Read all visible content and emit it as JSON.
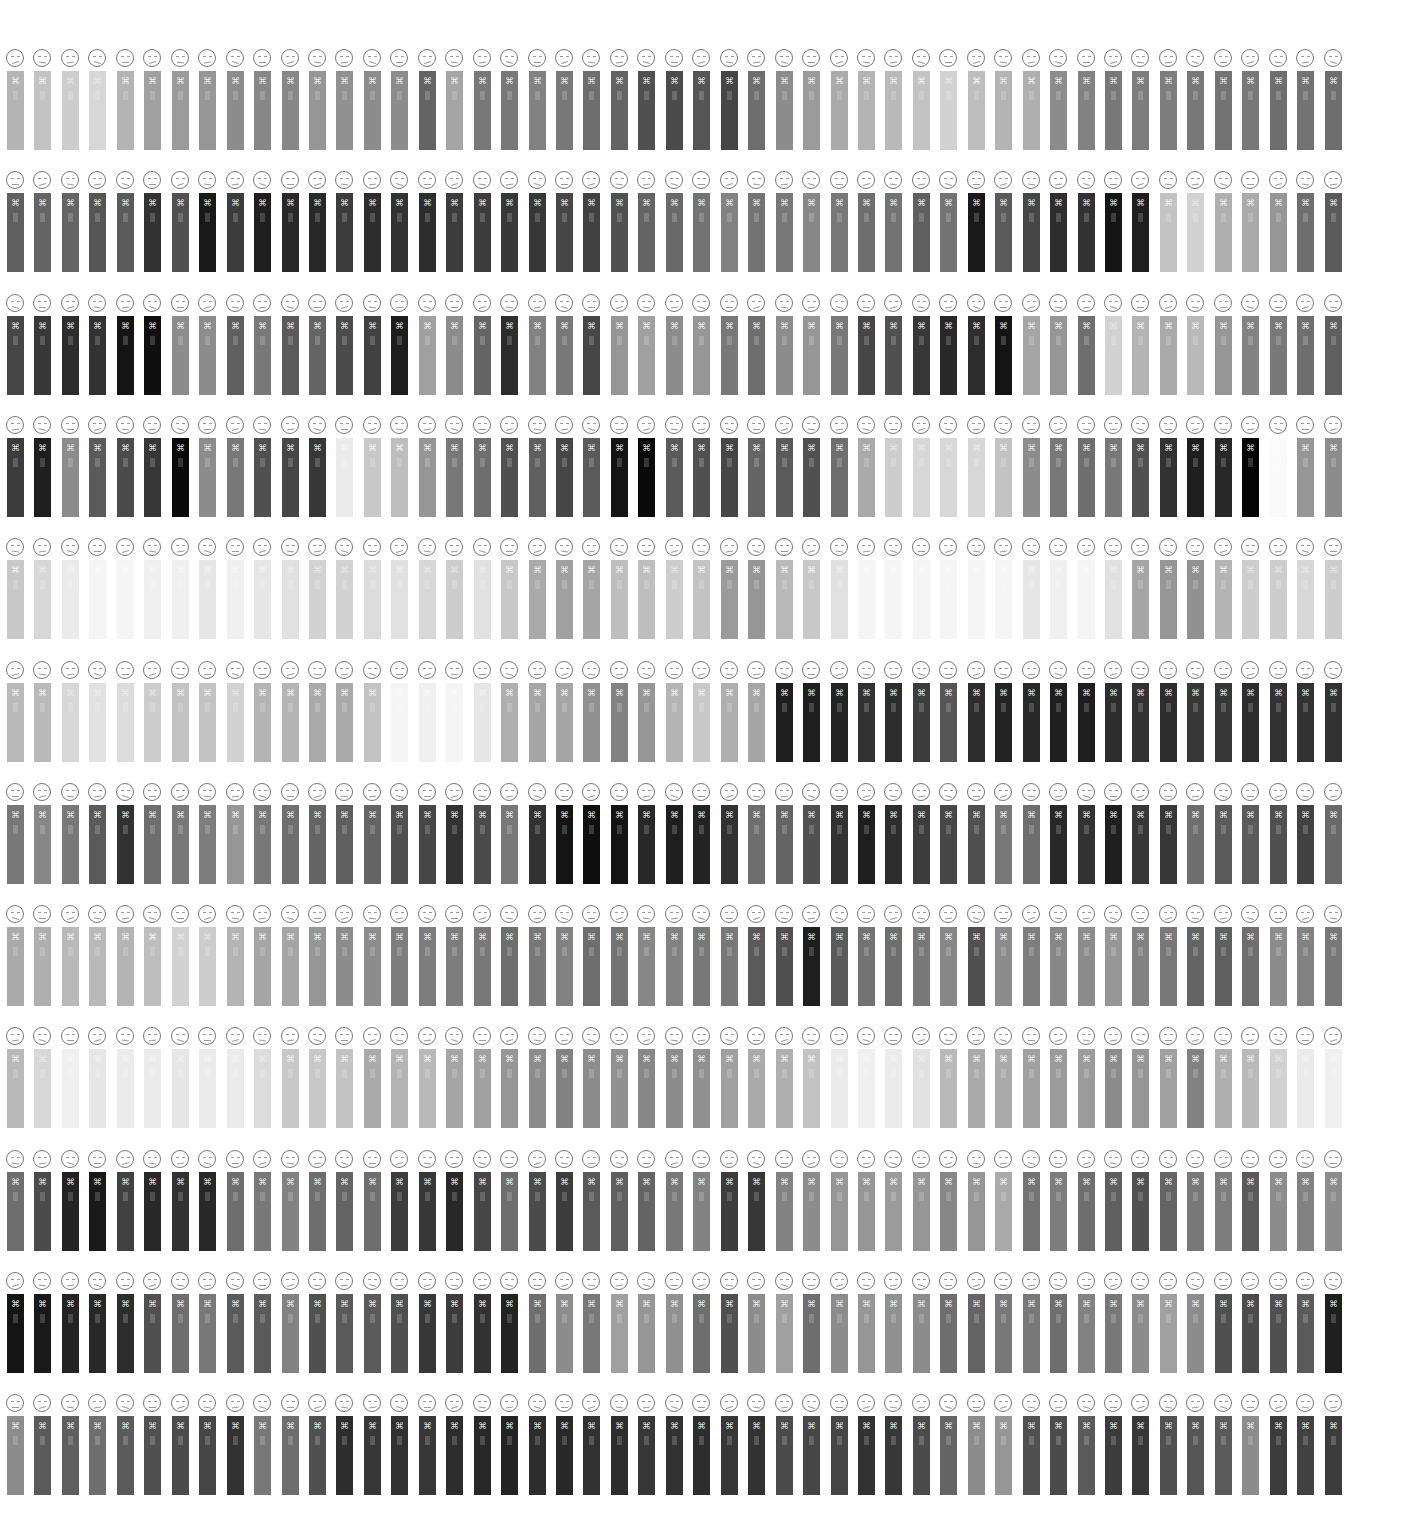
{
  "chart_data": {
    "type": "heatmap",
    "title": "",
    "rows": 12,
    "columns": 49,
    "layout": {
      "x0": 7,
      "x_pitch": 27.45,
      "y0": 50,
      "y_pitch": 122.3,
      "bar_width": 17,
      "bar_height": 79
    },
    "values": [
      [
        180,
        195,
        205,
        215,
        180,
        160,
        155,
        150,
        140,
        135,
        135,
        150,
        145,
        140,
        140,
        100,
        165,
        120,
        120,
        130,
        120,
        110,
        100,
        80,
        75,
        85,
        70,
        110,
        140,
        155,
        170,
        180,
        185,
        195,
        210,
        190,
        180,
        175,
        140,
        130,
        120,
        125,
        125,
        120,
        115,
        120,
        110,
        115,
        110
      ],
      [
        95,
        100,
        100,
        85,
        90,
        50,
        80,
        25,
        60,
        30,
        40,
        40,
        60,
        45,
        50,
        45,
        60,
        60,
        55,
        55,
        70,
        65,
        80,
        100,
        105,
        115,
        130,
        115,
        120,
        135,
        120,
        110,
        115,
        95,
        115,
        25,
        90,
        70,
        45,
        50,
        20,
        30,
        195,
        210,
        175,
        170,
        150,
        110,
        90
      ],
      [
        70,
        55,
        45,
        50,
        20,
        15,
        140,
        140,
        95,
        120,
        90,
        100,
        75,
        65,
        30,
        160,
        140,
        100,
        45,
        130,
        120,
        70,
        150,
        160,
        140,
        150,
        120,
        110,
        140,
        150,
        120,
        70,
        80,
        55,
        40,
        45,
        20,
        165,
        150,
        110,
        210,
        180,
        170,
        185,
        150,
        130,
        120,
        110,
        95
      ],
      [
        60,
        30,
        140,
        90,
        75,
        55,
        10,
        140,
        120,
        80,
        70,
        55,
        235,
        200,
        190,
        150,
        120,
        110,
        80,
        95,
        70,
        90,
        20,
        10,
        90,
        80,
        70,
        100,
        90,
        80,
        110,
        170,
        205,
        215,
        215,
        215,
        195,
        140,
        120,
        110,
        120,
        80,
        50,
        30,
        40,
        5,
        250,
        150,
        140
      ],
      [
        200,
        215,
        235,
        245,
        245,
        240,
        240,
        230,
        240,
        230,
        225,
        210,
        210,
        220,
        225,
        215,
        205,
        225,
        200,
        170,
        160,
        165,
        190,
        190,
        205,
        195,
        155,
        150,
        185,
        200,
        225,
        245,
        245,
        245,
        245,
        245,
        245,
        230,
        240,
        245,
        225,
        165,
        150,
        145,
        180,
        205,
        205,
        215,
        205
      ],
      [
        185,
        185,
        215,
        225,
        220,
        205,
        195,
        195,
        210,
        180,
        180,
        170,
        170,
        195,
        245,
        240,
        245,
        230,
        175,
        165,
        165,
        145,
        130,
        150,
        180,
        200,
        175,
        165,
        30,
        30,
        35,
        50,
        45,
        60,
        85,
        45,
        35,
        40,
        30,
        30,
        45,
        50,
        45,
        55,
        55,
        45,
        50,
        50,
        50
      ],
      [
        120,
        135,
        120,
        90,
        50,
        110,
        120,
        125,
        150,
        120,
        110,
        100,
        95,
        100,
        80,
        70,
        50,
        75,
        120,
        50,
        20,
        15,
        20,
        40,
        30,
        35,
        50,
        110,
        100,
        80,
        50,
        30,
        45,
        60,
        70,
        80,
        120,
        110,
        40,
        50,
        30,
        55,
        55,
        110,
        90,
        90,
        80,
        65,
        105
      ],
      [
        170,
        175,
        185,
        185,
        180,
        190,
        210,
        205,
        180,
        165,
        165,
        150,
        140,
        140,
        125,
        125,
        125,
        120,
        110,
        120,
        130,
        110,
        115,
        135,
        130,
        120,
        120,
        90,
        80,
        30,
        90,
        115,
        110,
        120,
        135,
        80,
        140,
        125,
        135,
        140,
        150,
        130,
        120,
        100,
        95,
        110,
        140,
        130,
        120
      ],
      [
        185,
        215,
        240,
        230,
        235,
        235,
        230,
        235,
        235,
        220,
        200,
        200,
        195,
        170,
        180,
        185,
        165,
        160,
        150,
        140,
        130,
        140,
        145,
        135,
        140,
        145,
        160,
        170,
        175,
        195,
        235,
        240,
        235,
        225,
        185,
        170,
        170,
        160,
        155,
        155,
        140,
        150,
        160,
        130,
        175,
        185,
        210,
        235,
        240
      ],
      [
        110,
        75,
        35,
        25,
        65,
        40,
        50,
        40,
        110,
        120,
        130,
        110,
        100,
        110,
        60,
        55,
        40,
        70,
        110,
        75,
        60,
        90,
        95,
        100,
        120,
        130,
        60,
        55,
        130,
        140,
        150,
        150,
        155,
        150,
        135,
        150,
        170,
        115,
        125,
        110,
        95,
        80,
        100,
        120,
        125,
        90,
        140,
        130,
        140
      ],
      [
        20,
        25,
        35,
        40,
        45,
        80,
        110,
        120,
        90,
        90,
        130,
        80,
        90,
        90,
        80,
        55,
        60,
        50,
        35,
        110,
        140,
        120,
        160,
        150,
        145,
        110,
        80,
        140,
        160,
        110,
        140,
        150,
        145,
        140,
        110,
        100,
        120,
        120,
        110,
        130,
        120,
        140,
        160,
        140,
        80,
        75,
        80,
        90,
        30
      ],
      [
        140,
        90,
        95,
        110,
        90,
        80,
        75,
        70,
        50,
        120,
        110,
        80,
        45,
        55,
        50,
        55,
        45,
        40,
        35,
        45,
        40,
        50,
        45,
        55,
        50,
        45,
        55,
        50,
        75,
        70,
        70,
        50,
        55,
        75,
        100,
        140,
        150,
        80,
        75,
        90,
        60,
        55,
        80,
        85,
        90,
        140,
        60,
        65,
        60
      ]
    ],
    "xlabel": "",
    "ylabel": "",
    "legend": [],
    "grid": false
  },
  "icons": {
    "face": "hand-drawn-face-icon",
    "bar_mark": "figure-emblem-icon"
  },
  "glyphs": {
    "bar_mark": "⌘"
  },
  "colors": {
    "background": "#ffffff",
    "face_stroke": "#777777"
  }
}
